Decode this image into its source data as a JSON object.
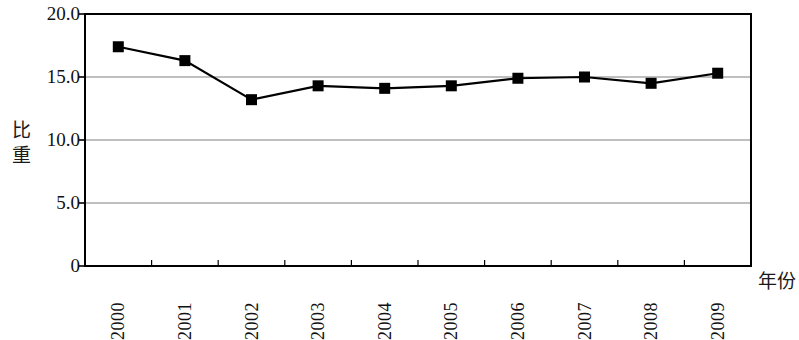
{
  "chart_data": {
    "type": "line",
    "title": "",
    "subtitle": "",
    "xlabel": "年份",
    "ylabel": "比重",
    "categories": [
      "2000",
      "2001",
      "2002",
      "2003",
      "2004",
      "2005",
      "2006",
      "2007",
      "2008",
      "2009"
    ],
    "values": [
      17.4,
      16.3,
      13.2,
      14.3,
      14.1,
      14.3,
      14.9,
      15.0,
      14.5,
      15.3
    ],
    "series": [
      {
        "name": "比重",
        "values": [
          17.4,
          16.3,
          13.2,
          14.3,
          14.1,
          14.3,
          14.9,
          15.0,
          14.5,
          15.3
        ]
      }
    ],
    "ylim": [
      0,
      20
    ],
    "ytick_labels": [
      "0",
      "5.0",
      "10.0",
      "15.0",
      "20.0"
    ],
    "ytick_values": [
      0,
      5,
      10,
      15,
      20
    ],
    "grid": "horizontal",
    "legend": "none",
    "marker": "square",
    "line_color": "#000000",
    "marker_color": "#000000",
    "grid_color": "#808080",
    "axis_color": "#000000",
    "background": "#ffffff"
  }
}
